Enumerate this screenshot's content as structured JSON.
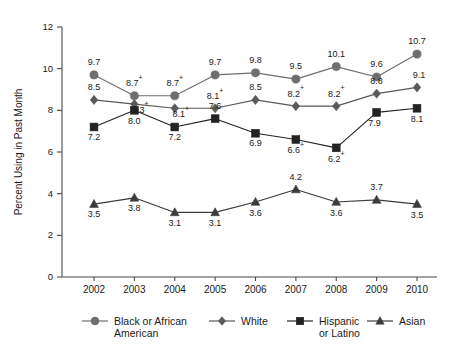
{
  "chart_data": {
    "type": "line",
    "title": "",
    "xlabel": "",
    "ylabel": "Percent Using in Past Month",
    "categories": [
      "2002",
      "2003",
      "2004",
      "2005",
      "2006",
      "2007",
      "2008",
      "2009",
      "2010"
    ],
    "x": [
      2002,
      2003,
      2004,
      2005,
      2006,
      2007,
      2008,
      2009,
      2010
    ],
    "ylim": [
      0,
      12
    ],
    "xlim": [
      2002,
      2010
    ],
    "yticks": [
      "0",
      "2",
      "4",
      "6",
      "8",
      "10",
      "12"
    ],
    "ytick_values": [
      0,
      2,
      4,
      6,
      8,
      10,
      12
    ],
    "grid": false,
    "legend_position": "bottom",
    "series": [
      {
        "name": "Black or African American",
        "marker": "circle",
        "color": "#6e6e6e",
        "values": [
          9.7,
          8.7,
          8.7,
          9.7,
          9.8,
          9.5,
          10.1,
          9.6,
          10.7
        ],
        "labels": [
          "9.7",
          "8.7",
          "8.7",
          "9.7",
          "9.8",
          "9.5",
          "10.1",
          "9.6",
          "10.7"
        ],
        "label_marks": [
          "",
          "+",
          "+",
          "",
          "",
          "",
          "",
          "",
          ""
        ]
      },
      {
        "name": "White",
        "marker": "diamond",
        "color": "#5a5a5a",
        "values": [
          8.5,
          8.3,
          8.1,
          8.1,
          8.5,
          8.2,
          8.2,
          8.8,
          9.1
        ],
        "labels": [
          "8.5",
          "8.3",
          "8.1",
          "8.1",
          "8.5",
          "8.2",
          "8.2",
          "8.8",
          "9.1"
        ],
        "label_marks": [
          "",
          "+",
          "+",
          "+",
          "",
          "+",
          "+",
          "",
          ""
        ]
      },
      {
        "name": "Hispanic or Latino",
        "marker": "square",
        "color": "#232323",
        "values": [
          7.2,
          8.0,
          7.2,
          7.6,
          6.9,
          6.6,
          6.2,
          7.9,
          8.1
        ],
        "labels": [
          "7.2",
          "8.0",
          "7.2",
          "7.6",
          "6.9",
          "6.6",
          "6.2",
          "7.9",
          "8.1"
        ],
        "label_marks": [
          "",
          "",
          "",
          "",
          "",
          "+",
          "+",
          "",
          ""
        ]
      },
      {
        "name": "Asian",
        "marker": "triangle",
        "color": "#3c3c3c",
        "values": [
          3.5,
          3.8,
          3.1,
          3.1,
          3.6,
          4.2,
          3.6,
          3.7,
          3.5
        ],
        "labels": [
          "3.5",
          "3.8",
          "3.1",
          "3.1",
          "3.6",
          "4.2",
          "3.6",
          "3.7",
          "3.5"
        ],
        "label_marks": [
          "",
          "",
          "",
          "",
          "",
          "",
          "",
          "",
          ""
        ]
      }
    ]
  },
  "legend": {
    "entries": [
      {
        "line1": "Black or African",
        "line2": "American",
        "marker": "circle-icon"
      },
      {
        "line1": "White",
        "line2": "",
        "marker": "diamond-icon"
      },
      {
        "line1": "Hispanic",
        "line2": "or Latino",
        "marker": "square-icon"
      },
      {
        "line1": "Asian",
        "line2": "",
        "marker": "triangle-icon"
      }
    ]
  },
  "colors": {
    "axis": "#4a4a4a",
    "text": "#1a1a1a",
    "background": "#ffffff"
  }
}
